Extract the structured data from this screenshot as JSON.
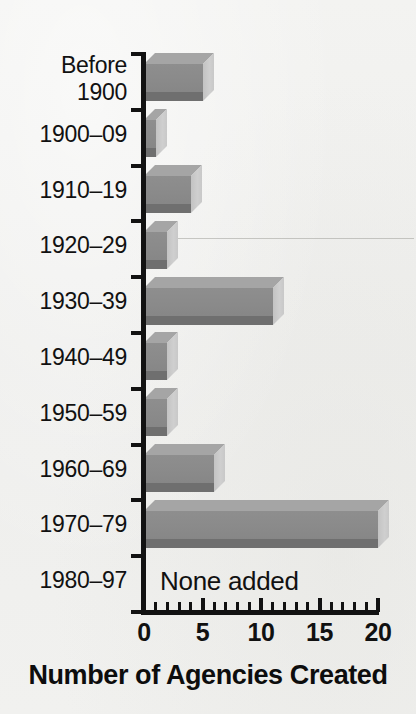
{
  "chart_data": {
    "type": "bar",
    "orientation": "horizontal",
    "style": "3d-grayscale",
    "title": "",
    "xlabel": "Number of Agencies Created",
    "ylabel": "",
    "xlim": [
      0,
      20
    ],
    "x_major_ticks": [
      0,
      5,
      10,
      15,
      20
    ],
    "x_minor_tick_step": 1,
    "grid": false,
    "legend": false,
    "categories": [
      "Before 1900",
      "1900–09",
      "1910–19",
      "1920–29",
      "1930–39",
      "1940–49",
      "1950–59",
      "1960–69",
      "1970–79",
      "1980–97"
    ],
    "values": [
      5,
      1,
      4,
      2,
      11,
      2,
      2,
      6,
      20,
      0
    ],
    "annotations": [
      {
        "category": "1980–97",
        "text": "None added"
      }
    ]
  },
  "axis": {
    "x_tick_labels": [
      "0",
      "5",
      "10",
      "15",
      "20"
    ],
    "title": "Number of Agencies Created"
  },
  "category_labels": [
    {
      "line1": "Before",
      "line2": "1900"
    },
    {
      "line1": "1900–09",
      "line2": ""
    },
    {
      "line1": "1910–19",
      "line2": ""
    },
    {
      "line1": "1920–29",
      "line2": ""
    },
    {
      "line1": "1930–39",
      "line2": ""
    },
    {
      "line1": "1940–49",
      "line2": ""
    },
    {
      "line1": "1950–59",
      "line2": ""
    },
    {
      "line1": "1960–69",
      "line2": ""
    },
    {
      "line1": "1970–79",
      "line2": ""
    },
    {
      "line1": "1980–97",
      "line2": ""
    }
  ],
  "none_added_text": "None added",
  "colors": {
    "background": "#f1f1ef",
    "bar_front": "#8a8a8a",
    "bar_top": "#a5a5a5",
    "bar_side": "#c9c9c9",
    "bar_bottom": "#6f6f6f",
    "axis": "#121212",
    "text": "#111111"
  }
}
